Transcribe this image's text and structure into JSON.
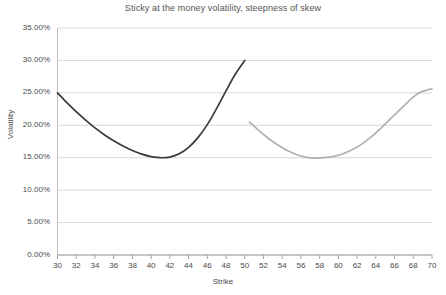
{
  "chart_data": {
    "type": "line",
    "title": "Sticky at the money volatility, steepness of skew",
    "xlabel": "Strike",
    "ylabel": "Volatility",
    "xlim": [
      30,
      70
    ],
    "ylim": [
      0,
      0.35
    ],
    "grid": true,
    "legend": "none",
    "y_ticks": [
      "0.00%",
      "5.00%",
      "10.00%",
      "15.00%",
      "20.00%",
      "25.00%",
      "30.00%",
      "35.00%"
    ],
    "y_tick_values": [
      0,
      0.05,
      0.1,
      0.15,
      0.2,
      0.25,
      0.3,
      0.35
    ],
    "x_ticks": [
      "30",
      "32",
      "34",
      "36",
      "38",
      "40",
      "42",
      "44",
      "46",
      "48",
      "50",
      "52",
      "54",
      "56",
      "58",
      "60",
      "62",
      "64",
      "66",
      "68",
      "70"
    ],
    "x_tick_values": [
      30,
      32,
      34,
      36,
      38,
      40,
      42,
      44,
      46,
      48,
      50,
      52,
      54,
      56,
      58,
      60,
      62,
      64,
      66,
      68,
      70
    ],
    "series": [
      {
        "name": "initial-skew",
        "color": "#3a3a3a",
        "x": [
          30,
          31,
          32,
          33,
          34,
          35,
          36,
          37,
          38,
          39,
          40,
          41,
          42,
          43,
          44,
          45,
          46,
          47,
          48,
          49,
          50
        ],
        "values": [
          0.25,
          0.235,
          0.221,
          0.208,
          0.196,
          0.1855,
          0.176,
          0.168,
          0.161,
          0.1555,
          0.1518,
          0.15,
          0.151,
          0.156,
          0.166,
          0.181,
          0.201,
          0.226,
          0.253,
          0.279,
          0.3
        ]
      },
      {
        "name": "shifted-skew",
        "color": "#b0b0b0",
        "x": [
          50.5,
          51.5,
          52.5,
          53.5,
          54.5,
          55.5,
          56.5,
          57.5,
          58.5,
          59.5,
          60.5,
          61.5,
          62.5,
          63.5,
          64.5,
          65.5,
          66.5,
          67.5,
          68.5,
          69.5,
          70
        ],
        "values": [
          0.205,
          0.192,
          0.18,
          0.17,
          0.1615,
          0.155,
          0.151,
          0.1495,
          0.15,
          0.152,
          0.156,
          0.1625,
          0.171,
          0.182,
          0.195,
          0.209,
          0.223,
          0.237,
          0.249,
          0.2545,
          0.256
        ]
      }
    ]
  }
}
